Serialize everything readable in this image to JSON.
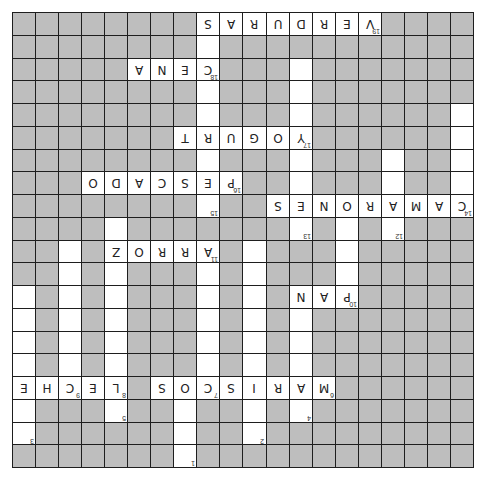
{
  "puzzle": {
    "orientation": "rotated-180",
    "rows": 20,
    "cols": 20,
    "colors": {
      "block": "#bebebe",
      "open": "#ffffff",
      "border": "#1e1e1e"
    },
    "cells": [
      {
        "r": 0,
        "c": 8,
        "l": "S"
      },
      {
        "r": 0,
        "c": 9,
        "l": "A"
      },
      {
        "r": 0,
        "c": 10,
        "l": "R"
      },
      {
        "r": 0,
        "c": 11,
        "l": "U"
      },
      {
        "r": 0,
        "c": 12,
        "l": "D"
      },
      {
        "r": 0,
        "c": 13,
        "l": "R"
      },
      {
        "r": 0,
        "c": 14,
        "l": "E"
      },
      {
        "r": 0,
        "c": 15,
        "l": "V",
        "n": "19"
      },
      {
        "r": 1,
        "c": 8,
        "l": ""
      },
      {
        "r": 2,
        "c": 5,
        "l": "A"
      },
      {
        "r": 2,
        "c": 6,
        "l": "N"
      },
      {
        "r": 2,
        "c": 7,
        "l": "E"
      },
      {
        "r": 2,
        "c": 8,
        "l": "C",
        "n": "18"
      },
      {
        "r": 2,
        "c": 12,
        "l": ""
      },
      {
        "r": 3,
        "c": 8,
        "l": ""
      },
      {
        "r": 3,
        "c": 12,
        "l": ""
      },
      {
        "r": 4,
        "c": 8,
        "l": ""
      },
      {
        "r": 4,
        "c": 12,
        "l": ""
      },
      {
        "r": 4,
        "c": 19,
        "l": ""
      },
      {
        "r": 5,
        "c": 7,
        "l": "T"
      },
      {
        "r": 5,
        "c": 8,
        "l": "R"
      },
      {
        "r": 5,
        "c": 9,
        "l": "U"
      },
      {
        "r": 5,
        "c": 10,
        "l": "G"
      },
      {
        "r": 5,
        "c": 11,
        "l": "O"
      },
      {
        "r": 5,
        "c": 12,
        "l": "Y",
        "n": "17"
      },
      {
        "r": 5,
        "c": 19,
        "l": ""
      },
      {
        "r": 6,
        "c": 8,
        "l": ""
      },
      {
        "r": 6,
        "c": 12,
        "l": ""
      },
      {
        "r": 6,
        "c": 16,
        "l": ""
      },
      {
        "r": 6,
        "c": 19,
        "l": ""
      },
      {
        "r": 7,
        "c": 3,
        "l": "O"
      },
      {
        "r": 7,
        "c": 4,
        "l": "D"
      },
      {
        "r": 7,
        "c": 5,
        "l": "A"
      },
      {
        "r": 7,
        "c": 6,
        "l": "C"
      },
      {
        "r": 7,
        "c": 7,
        "l": "S"
      },
      {
        "r": 7,
        "c": 8,
        "l": "E"
      },
      {
        "r": 7,
        "c": 9,
        "l": "P",
        "n": "16"
      },
      {
        "r": 7,
        "c": 12,
        "l": ""
      },
      {
        "r": 7,
        "c": 16,
        "l": ""
      },
      {
        "r": 7,
        "c": 19,
        "l": ""
      },
      {
        "r": 8,
        "c": 8,
        "l": "",
        "n": "15"
      },
      {
        "r": 8,
        "c": 11,
        "l": "S"
      },
      {
        "r": 8,
        "c": 12,
        "l": "E"
      },
      {
        "r": 8,
        "c": 13,
        "l": "N"
      },
      {
        "r": 8,
        "c": 14,
        "l": "O"
      },
      {
        "r": 8,
        "c": 15,
        "l": "R"
      },
      {
        "r": 8,
        "c": 16,
        "l": "A"
      },
      {
        "r": 8,
        "c": 17,
        "l": "M"
      },
      {
        "r": 8,
        "c": 18,
        "l": "A"
      },
      {
        "r": 8,
        "c": 19,
        "l": "C",
        "n": "14"
      },
      {
        "r": 9,
        "c": 4,
        "l": ""
      },
      {
        "r": 9,
        "c": 12,
        "l": "",
        "n": "13"
      },
      {
        "r": 9,
        "c": 14,
        "l": ""
      },
      {
        "r": 9,
        "c": 16,
        "l": "",
        "n": "12"
      },
      {
        "r": 10,
        "c": 2,
        "l": ""
      },
      {
        "r": 10,
        "c": 4,
        "l": "Z"
      },
      {
        "r": 10,
        "c": 5,
        "l": "O"
      },
      {
        "r": 10,
        "c": 6,
        "l": "R"
      },
      {
        "r": 10,
        "c": 7,
        "l": "R"
      },
      {
        "r": 10,
        "c": 8,
        "l": "A",
        "n": "11"
      },
      {
        "r": 10,
        "c": 10,
        "l": ""
      },
      {
        "r": 10,
        "c": 14,
        "l": ""
      },
      {
        "r": 11,
        "c": 2,
        "l": ""
      },
      {
        "r": 11,
        "c": 4,
        "l": ""
      },
      {
        "r": 11,
        "c": 8,
        "l": ""
      },
      {
        "r": 11,
        "c": 10,
        "l": ""
      },
      {
        "r": 11,
        "c": 14,
        "l": ""
      },
      {
        "r": 12,
        "c": 0,
        "l": ""
      },
      {
        "r": 12,
        "c": 2,
        "l": ""
      },
      {
        "r": 12,
        "c": 4,
        "l": ""
      },
      {
        "r": 12,
        "c": 8,
        "l": ""
      },
      {
        "r": 12,
        "c": 10,
        "l": ""
      },
      {
        "r": 12,
        "c": 12,
        "l": "N"
      },
      {
        "r": 12,
        "c": 13,
        "l": "A"
      },
      {
        "r": 12,
        "c": 14,
        "l": "P",
        "n": "10"
      },
      {
        "r": 13,
        "c": 0,
        "l": ""
      },
      {
        "r": 13,
        "c": 2,
        "l": ""
      },
      {
        "r": 13,
        "c": 4,
        "l": ""
      },
      {
        "r": 13,
        "c": 8,
        "l": ""
      },
      {
        "r": 13,
        "c": 10,
        "l": ""
      },
      {
        "r": 13,
        "c": 12,
        "l": ""
      },
      {
        "r": 14,
        "c": 0,
        "l": ""
      },
      {
        "r": 14,
        "c": 2,
        "l": ""
      },
      {
        "r": 14,
        "c": 4,
        "l": ""
      },
      {
        "r": 14,
        "c": 8,
        "l": ""
      },
      {
        "r": 14,
        "c": 10,
        "l": ""
      },
      {
        "r": 14,
        "c": 12,
        "l": ""
      },
      {
        "r": 15,
        "c": 0,
        "l": ""
      },
      {
        "r": 15,
        "c": 2,
        "l": ""
      },
      {
        "r": 15,
        "c": 4,
        "l": ""
      },
      {
        "r": 15,
        "c": 8,
        "l": ""
      },
      {
        "r": 15,
        "c": 10,
        "l": ""
      },
      {
        "r": 15,
        "c": 12,
        "l": ""
      },
      {
        "r": 16,
        "c": 0,
        "l": "E"
      },
      {
        "r": 16,
        "c": 1,
        "l": "H"
      },
      {
        "r": 16,
        "c": 2,
        "l": "C",
        "n": "9"
      },
      {
        "r": 16,
        "c": 3,
        "l": "E"
      },
      {
        "r": 16,
        "c": 4,
        "l": "L",
        "n": "8"
      },
      {
        "r": 16,
        "c": 6,
        "l": "S"
      },
      {
        "r": 16,
        "c": 7,
        "l": "O"
      },
      {
        "r": 16,
        "c": 8,
        "l": "C",
        "n": "7"
      },
      {
        "r": 16,
        "c": 9,
        "l": "S"
      },
      {
        "r": 16,
        "c": 10,
        "l": "I"
      },
      {
        "r": 16,
        "c": 11,
        "l": "R"
      },
      {
        "r": 16,
        "c": 12,
        "l": "A"
      },
      {
        "r": 16,
        "c": 13,
        "l": "M",
        "n": "6"
      },
      {
        "r": 17,
        "c": 0,
        "l": ""
      },
      {
        "r": 17,
        "c": 4,
        "l": "",
        "n": "5"
      },
      {
        "r": 17,
        "c": 7,
        "l": ""
      },
      {
        "r": 17,
        "c": 10,
        "l": ""
      },
      {
        "r": 17,
        "c": 12,
        "l": "",
        "n": "4"
      },
      {
        "r": 18,
        "c": 0,
        "l": "",
        "n": "3"
      },
      {
        "r": 18,
        "c": 7,
        "l": ""
      },
      {
        "r": 18,
        "c": 10,
        "l": "",
        "n": "2"
      },
      {
        "r": 19,
        "c": 7,
        "l": "",
        "n": "1"
      }
    ],
    "filled_words": [
      "VERDURAS",
      "CENA",
      "YOGURT",
      "PESCADO",
      "CAMARONES",
      "ARROZ",
      "PAN",
      "MARISCOS",
      "LECHE"
    ]
  }
}
